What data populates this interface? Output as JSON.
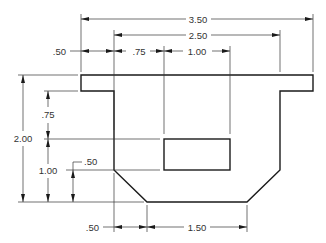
{
  "drawing": {
    "type": "orthographic dimensioned part drawing",
    "colors": {
      "line": "#1a1a1a",
      "background": "#ffffff"
    },
    "dimensions": {
      "horizontal_top": [
        {
          "id": "overall-width",
          "label": "3.50"
        },
        {
          "id": "inner-width",
          "label": "2.50"
        },
        {
          "id": "flange-overhang-left",
          "label": ".50"
        },
        {
          "id": "slot-offset",
          "label": ".75"
        },
        {
          "id": "slot-width",
          "label": "1.00"
        }
      ],
      "vertical_left": [
        {
          "id": "overall-height",
          "label": "2.00"
        },
        {
          "id": "wall-to-slot",
          "label": ".75"
        },
        {
          "id": "slot-height-from-base",
          "label": "1.00"
        },
        {
          "id": "chamfer-height",
          "label": ".50"
        }
      ],
      "horizontal_bottom": [
        {
          "id": "chamfer-width",
          "label": ".50"
        },
        {
          "id": "base-width",
          "label": "1.50"
        }
      ]
    }
  }
}
